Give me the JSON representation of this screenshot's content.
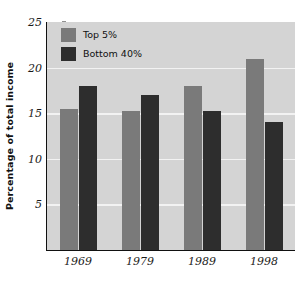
{
  "chart_data": {
    "type": "bar",
    "title": "",
    "xlabel": "",
    "ylabel": "Percentage of total income",
    "categories": [
      "1969",
      "1979",
      "1989",
      "1998"
    ],
    "series": [
      {
        "name": "Top 5%",
        "color": "#7a7a7a",
        "values": [
          15.5,
          15.2,
          18.0,
          20.9
        ]
      },
      {
        "name": "Bottom 40%",
        "color": "#2d2d2d",
        "values": [
          18.0,
          17.0,
          15.2,
          14.0
        ]
      }
    ],
    "ylim": [
      0,
      25
    ],
    "yticks": [
      5,
      10,
      15,
      20,
      25
    ],
    "ytick_labels": [
      "5",
      "10",
      "15",
      "20",
      "25"
    ],
    "grid": true,
    "grid_color": "#f2f2f2",
    "legend_position": "upper left",
    "plot_background": "#d4d4d4",
    "figure_background": "#ffffff",
    "axis_color": "#111111"
  },
  "axis": {
    "y_title": "Percentage of total income",
    "y_tick_labels": [
      "25",
      "20",
      "15",
      "10",
      "5"
    ],
    "x_tick_labels": [
      "1969",
      "1979",
      "1989",
      "1998"
    ]
  },
  "legend": {
    "entries": [
      {
        "label": "Top 5%",
        "swatch": "legend-swatch-top5"
      },
      {
        "label": "Bottom 40%",
        "swatch": "legend-swatch-bottom40"
      }
    ]
  }
}
